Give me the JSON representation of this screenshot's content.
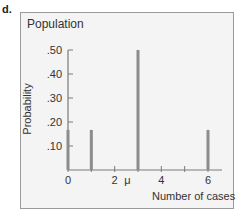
{
  "panel_label": "d.",
  "chart_data": {
    "type": "bar",
    "title": "Population",
    "xlabel": "Number of cases",
    "ylabel": "Probability",
    "x": [
      0,
      1,
      3,
      6
    ],
    "values": [
      0.167,
      0.167,
      0.5,
      0.167
    ],
    "xlim": [
      0,
      6
    ],
    "ylim": [
      0,
      0.5
    ],
    "x_ticks": [
      "0",
      "2",
      "4",
      "6"
    ],
    "x_annotation": "μ",
    "y_ticks": [
      ".10",
      ".20",
      ".30",
      ".40",
      ".50"
    ],
    "grid": false,
    "bar_color": "#8c8c8c"
  }
}
